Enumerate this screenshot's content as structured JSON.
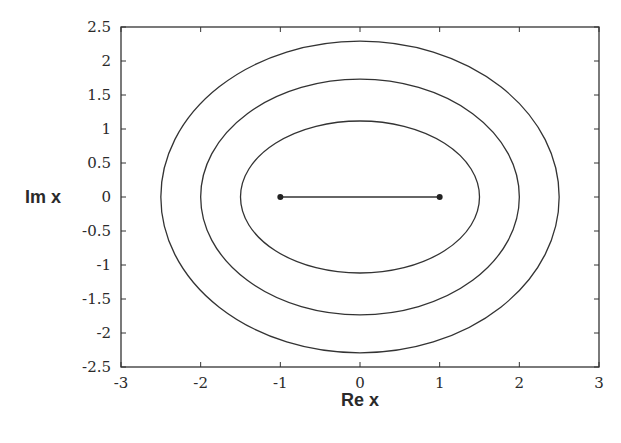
{
  "chart_data": {
    "type": "line",
    "title": "",
    "xlabel": "Re x",
    "ylabel": "Im x",
    "xlim": [
      -3,
      3
    ],
    "ylim": [
      -2.5,
      2.5
    ],
    "xticks": [
      -3,
      -2,
      -1,
      0,
      1,
      2,
      3
    ],
    "yticks": [
      -2.5,
      -2,
      -1.5,
      -1,
      -0.5,
      0,
      0.5,
      1,
      1.5,
      2,
      2.5
    ],
    "xtick_labels": [
      "-3",
      "-2",
      "-1",
      "0",
      "1",
      "2",
      "3"
    ],
    "ytick_labels": [
      "-2.5",
      "-2",
      "-1.5",
      "-1",
      "-0.5",
      "0",
      "0.5",
      "1",
      "1.5",
      "2",
      "2.5"
    ],
    "grid": false,
    "legend": null,
    "series": [
      {
        "name": "ellipse-inner",
        "kind": "ellipse",
        "center": [
          0,
          0
        ],
        "semi_major": 1.5,
        "semi_minor": 1.118
      },
      {
        "name": "ellipse-middle",
        "kind": "ellipse",
        "center": [
          0,
          0
        ],
        "semi_major": 2.0,
        "semi_minor": 1.732
      },
      {
        "name": "ellipse-outer",
        "kind": "ellipse",
        "center": [
          0,
          0
        ],
        "semi_major": 2.5,
        "semi_minor": 2.291
      },
      {
        "name": "branch-cut-segment",
        "kind": "segment",
        "x": [
          -1,
          1
        ],
        "y": [
          0,
          0
        ],
        "endpoint_markers": true
      }
    ],
    "line_color": "#333333"
  }
}
